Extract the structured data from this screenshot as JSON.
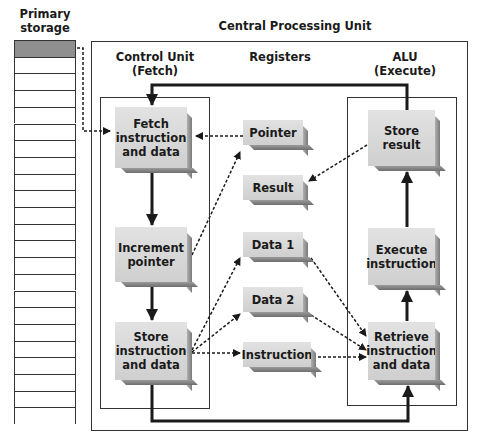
{
  "labels": {
    "primary_storage": "Primary\nstorage",
    "primary_storage_line1": "Primary",
    "primary_storage_line2": "storage",
    "cpu": "Central Processing Unit",
    "control_unit_line1": "Control Unit",
    "control_unit_line2": "(Fetch)",
    "registers": "Registers",
    "alu_line1": "ALU",
    "alu_line2": "(Execute)"
  },
  "control_unit": {
    "steps": [
      {
        "line1": "Fetch",
        "line2": "instruction",
        "line3": "and data"
      },
      {
        "line1": "Increment",
        "line2": "pointer"
      },
      {
        "line1": "Store",
        "line2": "instruction",
        "line3": "and data"
      }
    ]
  },
  "registers": {
    "items": [
      "Pointer",
      "Result",
      "Data 1",
      "Data 2",
      "Instruction"
    ]
  },
  "alu": {
    "steps": [
      {
        "line1": "Store",
        "line2": "result"
      },
      {
        "line1": "Execute",
        "line2": "instruction"
      },
      {
        "line1": "Retrieve",
        "line2": "instruction",
        "line3": "and data"
      }
    ]
  },
  "primary_storage": {
    "cell_count": 23,
    "highlighted_index": 0
  },
  "colors": {
    "line": "#1a1a1a",
    "box_face": "#d9d9d9",
    "highlight_cell": "#8f8f8f"
  }
}
